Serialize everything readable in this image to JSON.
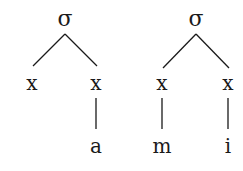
{
  "diagram": {
    "type": "syllable-tree",
    "trees": [
      {
        "root": "σ",
        "slots": [
          {
            "label": "x",
            "segment": null
          },
          {
            "label": "x",
            "segment": "a"
          }
        ]
      },
      {
        "root": "σ",
        "slots": [
          {
            "label": "x",
            "segment": "m"
          },
          {
            "label": "x",
            "segment": "i"
          }
        ]
      }
    ]
  }
}
